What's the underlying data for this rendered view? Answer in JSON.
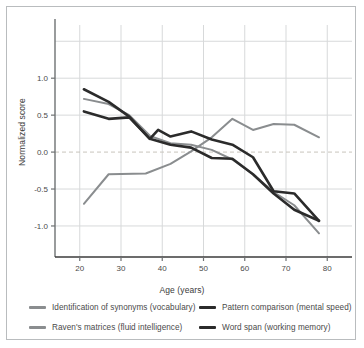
{
  "chart_data": {
    "type": "line",
    "title": "",
    "xlabel": "Age (years)",
    "ylabel": "Normalized score",
    "xlim": [
      14,
      86
    ],
    "ylim": [
      -1.42,
      1.72
    ],
    "xticks": [
      20,
      30,
      40,
      50,
      60,
      70,
      80
    ],
    "yticks": [
      1.0,
      0.5,
      0.0,
      -0.5,
      -1.0
    ],
    "gridlines_y": [
      1.5,
      1.0,
      0.5,
      0.0,
      -0.5,
      -1.0
    ],
    "grid": true,
    "zero_line": 0.0,
    "legend_position": "bottom",
    "colors": {
      "vocabulary": "#8a8d8f",
      "ravens": "#8a8d8f",
      "pattern": "#2b2b2b",
      "wordspan": "#2b2b2b",
      "grid": "#d7d9da",
      "axis": "#6e7173",
      "zero_dash": "#c8c4bc"
    },
    "series": [
      {
        "name": "Identification of synonyms (vocabulary)",
        "color": "#8a8d8f",
        "x": [
          21,
          27,
          36,
          42,
          47,
          52,
          57,
          62,
          67,
          72,
          78
        ],
        "y": [
          -0.7,
          -0.3,
          -0.29,
          -0.16,
          0.01,
          0.2,
          0.45,
          0.3,
          0.38,
          0.37,
          0.2
        ]
      },
      {
        "name": "Raven's matrices (fluid intelligence)",
        "color": "#8a8d8f",
        "x": [
          21,
          27,
          32,
          37,
          42,
          47,
          52,
          57,
          62,
          67,
          72,
          78
        ],
        "y": [
          0.72,
          0.65,
          0.5,
          0.22,
          0.12,
          0.1,
          0.03,
          -0.1,
          -0.3,
          -0.54,
          -0.72,
          -1.1
        ]
      },
      {
        "name": "Pattern comparison (mental speed)",
        "color": "#2b2b2b",
        "x": [
          21,
          27,
          32,
          37,
          39,
          42,
          47,
          52,
          57,
          62,
          67,
          72,
          78
        ],
        "y": [
          0.85,
          0.68,
          0.48,
          0.18,
          0.3,
          0.21,
          0.28,
          0.17,
          0.1,
          -0.07,
          -0.53,
          -0.56,
          -0.93
        ]
      },
      {
        "name": "Word span (working memory)",
        "color": "#2b2b2b",
        "x": [
          21,
          27,
          32,
          37,
          42,
          47,
          52,
          57,
          62,
          67,
          72,
          78
        ],
        "y": [
          0.55,
          0.45,
          0.47,
          0.18,
          0.1,
          0.06,
          -0.08,
          -0.09,
          -0.3,
          -0.56,
          -0.78,
          -0.93
        ]
      }
    ]
  },
  "legend": [
    {
      "label": "Identification of synonyms (vocabulary)",
      "color": "#8a8d8f",
      "weight": "thin"
    },
    {
      "label": "Raven's matrices (fluid intelligence)",
      "color": "#8a8d8f",
      "weight": "thin"
    },
    {
      "label": "Pattern comparison (mental speed)",
      "color": "#2b2b2b",
      "weight": "thick"
    },
    {
      "label": "Word span (working memory)",
      "color": "#2b2b2b",
      "weight": "thick"
    }
  ],
  "axes": {
    "x_title": "Age (years)",
    "y_title": "Normalized score",
    "x_ticks": [
      "20",
      "30",
      "40",
      "50",
      "60",
      "70",
      "80"
    ],
    "y_ticks": [
      "1.0",
      "0.5",
      "0.0",
      "-0.5",
      "-1.0"
    ]
  }
}
